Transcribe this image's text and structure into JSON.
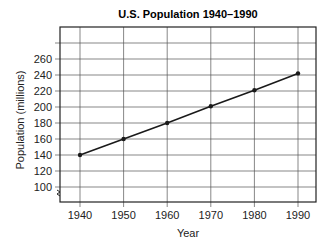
{
  "chart_data": {
    "type": "line",
    "title": "U.S. Population 1940–1990",
    "xlabel": "Year",
    "ylabel": "Population (millions)",
    "categories": [
      "1940",
      "1950",
      "1960",
      "1970",
      "1980",
      "1990"
    ],
    "series": [
      {
        "name": "U.S. Population",
        "values": [
          140,
          160,
          180,
          201,
          221,
          242
        ]
      }
    ],
    "y_ticks": [
      "100",
      "120",
      "140",
      "160",
      "180",
      "200",
      "220",
      "240",
      "260"
    ],
    "ylim": [
      90,
      300
    ],
    "xlim": [
      1935,
      1995
    ],
    "grid": true,
    "axis_break": true,
    "legend": "none",
    "line_color": "#1a1a1a"
  }
}
